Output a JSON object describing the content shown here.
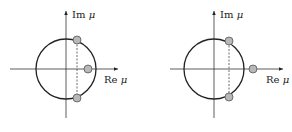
{
  "figure": {
    "panels": [
      {
        "id": "left",
        "axis_labels": {
          "imag": "Im",
          "real": "Re",
          "symbol": "μ"
        },
        "points": [
          {
            "position": "on-circle-upper"
          },
          {
            "position": "on-circle-lower"
          },
          {
            "position": "real-axis-inside-circle"
          }
        ]
      },
      {
        "id": "right",
        "axis_labels": {
          "imag": "Im",
          "real": "Re",
          "symbol": "μ"
        },
        "points": [
          {
            "position": "on-circle-upper"
          },
          {
            "position": "on-circle-lower"
          },
          {
            "position": "real-axis-outside-circle"
          }
        ]
      }
    ],
    "colors": {
      "stroke": "#222222",
      "point_fill": "#b8b8b8",
      "point_stroke": "#555555"
    }
  }
}
